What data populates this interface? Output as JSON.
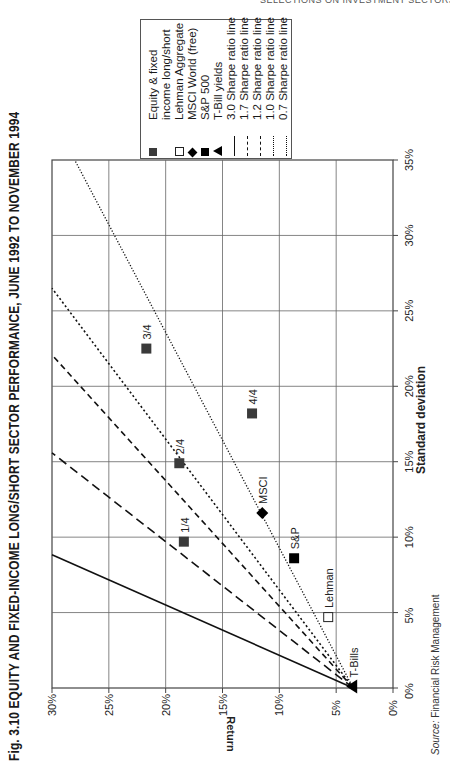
{
  "page": {
    "running_header": "SELECTIONS ON INVESTMENT SECTORS AND S",
    "title": "Fig. 3.10  EQUITY AND FIXED-INCOME LONG/SHORT SECTOR PERFORMANCE, JUNE 1992 TO NOVEMBER 1994",
    "source_label": "Source:",
    "source_text": "Financial Risk Management"
  },
  "legend": {
    "items": [
      {
        "symbol": "dark-square",
        "label": "Equity & fixed"
      },
      {
        "symbol": "",
        "label": "income long/short"
      },
      {
        "symbol": "open-square",
        "label": "Lehman Aggregate"
      },
      {
        "symbol": "diamond",
        "label": "MSCI World (free)"
      },
      {
        "symbol": "black-square",
        "label": "S&P 500"
      },
      {
        "symbol": "triangle",
        "label": "T-Bill yields"
      },
      {
        "symbol": "solid-line",
        "label": "3.0 Sharpe ratio line"
      },
      {
        "symbol": "long-dash-line",
        "label": "1.7 Sharpe ratio line"
      },
      {
        "symbol": "dash-line",
        "label": "1.2 Sharpe ratio line"
      },
      {
        "symbol": "dot-dash-line",
        "label": "1.0 Sharpe ratio line"
      },
      {
        "symbol": "dotted-line",
        "label": "0.7 Sharpe ratio line"
      }
    ]
  },
  "chart_data": {
    "type": "scatter",
    "title": "Fig. 3.10 EQUITY AND FIXED-INCOME LONG/SHORT SECTOR PERFORMANCE, JUNE 1992 TO NOVEMBER 1994",
    "orientation": "rotated 90 degrees counter-clockwise on page",
    "xlabel": "Standard deviation",
    "ylabel": "Return",
    "xlim": [
      0,
      35
    ],
    "ylim": [
      0,
      30
    ],
    "x_ticks": [
      "0%",
      "5%",
      "10%",
      "15%",
      "20%",
      "25%",
      "30%",
      "35%"
    ],
    "y_ticks": [
      "0%",
      "5%",
      "10%",
      "15%",
      "20%",
      "25%",
      "30%"
    ],
    "grid": true,
    "legend_position": "top-right (page top)",
    "points": [
      {
        "label": "1/4",
        "series": "Equity & fixed income long/short",
        "std_dev": 9.7,
        "return": 18.4,
        "marker": "dark-square"
      },
      {
        "label": "2/4",
        "series": "Equity & fixed income long/short",
        "std_dev": 14.9,
        "return": 18.8,
        "marker": "dark-square"
      },
      {
        "label": "3/4",
        "series": "Equity & fixed income long/short",
        "std_dev": 22.5,
        "return": 21.7,
        "marker": "dark-square"
      },
      {
        "label": "4/4",
        "series": "Equity & fixed income long/short",
        "std_dev": 18.2,
        "return": 12.4,
        "marker": "dark-square"
      },
      {
        "label": "Lehman",
        "series": "Lehman Aggregate",
        "std_dev": 4.7,
        "return": 5.7,
        "marker": "open-square"
      },
      {
        "label": "MSCI",
        "series": "MSCI World (free)",
        "std_dev": 11.6,
        "return": 11.5,
        "marker": "diamond"
      },
      {
        "label": "S&P",
        "series": "S&P 500",
        "std_dev": 8.6,
        "return": 8.7,
        "marker": "black-square"
      },
      {
        "label": "T-Bills",
        "series": "T-Bill yields",
        "std_dev": 0.1,
        "return": 3.5,
        "marker": "triangle"
      }
    ],
    "sharpe_lines": [
      {
        "name": "3.0 Sharpe ratio line",
        "intercept": 3.5,
        "slope": 3.0,
        "style": "solid"
      },
      {
        "name": "1.7 Sharpe ratio line",
        "intercept": 3.5,
        "slope": 1.7,
        "style": "long-dash"
      },
      {
        "name": "1.2 Sharpe ratio line",
        "intercept": 3.5,
        "slope": 1.2,
        "style": "dash"
      },
      {
        "name": "1.0 Sharpe ratio line",
        "intercept": 3.5,
        "slope": 1.0,
        "style": "dot-dash"
      },
      {
        "name": "0.7 Sharpe ratio line",
        "intercept": 3.5,
        "slope": 0.7,
        "style": "dotted"
      }
    ]
  }
}
